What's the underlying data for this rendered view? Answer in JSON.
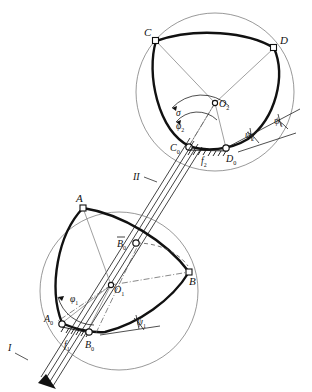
{
  "figure": {
    "type": "mechanism-schematic",
    "background": "#ffffff",
    "stroke": "#111111",
    "thin_stroke": "#4a4a4a"
  },
  "upper_mechanism": {
    "name": "mechanism-II",
    "center_label": "O",
    "center_sub": "2",
    "circle": {
      "cx": 215,
      "cy": 92,
      "r": 79
    },
    "pivot_center": {
      "x": 215,
      "y": 103
    },
    "vertices": [
      {
        "id": "C",
        "label": "C",
        "sub": "",
        "x": 156,
        "y": 41,
        "marker": "square"
      },
      {
        "id": "D",
        "label": "D",
        "sub": "",
        "x": 274,
        "y": 48,
        "marker": "square"
      },
      {
        "id": "C0",
        "label": "C",
        "sub": "0",
        "x": 189,
        "y": 146,
        "marker": "circle"
      },
      {
        "id": "D0",
        "label": "D",
        "sub": "0",
        "x": 226,
        "y": 148,
        "marker": "circle"
      }
    ],
    "angles": [
      {
        "id": "sigma",
        "label": "σ",
        "sub": "",
        "x": 178,
        "y": 114
      },
      {
        "id": "phi2",
        "label": "φ",
        "sub": "2",
        "x": 180,
        "y": 127
      },
      {
        "id": "psi1",
        "label": "ψ",
        "sub": "1",
        "x": 277,
        "y": 124
      },
      {
        "id": "psi2",
        "label": "ψ",
        "sub": "2",
        "x": 250,
        "y": 136
      }
    ],
    "ground": {
      "id": "f2",
      "label": "f",
      "sub": "2",
      "x": 205,
      "y": 161
    },
    "link_label": {
      "id": "II",
      "text": "II",
      "x": 139,
      "y": 177
    }
  },
  "lower_mechanism": {
    "name": "mechanism-I",
    "center_label": "O",
    "center_sub": "1",
    "circle": {
      "cx": 120,
      "cy": 291,
      "r": 79
    },
    "pivot_center": {
      "x": 111,
      "y": 285
    },
    "vertices": [
      {
        "id": "A",
        "label": "A",
        "sub": "",
        "x": 83,
        "y": 208,
        "marker": "square"
      },
      {
        "id": "B",
        "label": "B",
        "sub": "",
        "x": 189,
        "y": 272,
        "marker": "square"
      },
      {
        "id": "A0",
        "label": "A",
        "sub": "0",
        "x": 62,
        "y": 323,
        "marker": "circle"
      },
      {
        "id": "B0",
        "label": "B",
        "sub": "0",
        "x": 88,
        "y": 330,
        "marker": "circle"
      },
      {
        "id": "B0bar",
        "label": "B",
        "sub": "0",
        "overbar": true,
        "x": 136,
        "y": 243,
        "marker": "circle"
      }
    ],
    "angles": [
      {
        "id": "phi1",
        "label": "φ",
        "sub": "1",
        "x": 75,
        "y": 299
      },
      {
        "id": "psi1",
        "label": "ψ",
        "sub": "1",
        "x": 142,
        "y": 327
      }
    ],
    "ground": {
      "id": "f1",
      "label": "f",
      "sub": "1",
      "x": 68,
      "y": 345
    },
    "link_label": {
      "id": "I",
      "text": "I",
      "x": 12,
      "y": 348
    }
  },
  "coupler": {
    "name": "coupler-rod",
    "from": {
      "x": 44,
      "y": 381
    },
    "to": {
      "x": 196,
      "y": 139
    },
    "labels": [
      "I",
      "II"
    ]
  }
}
